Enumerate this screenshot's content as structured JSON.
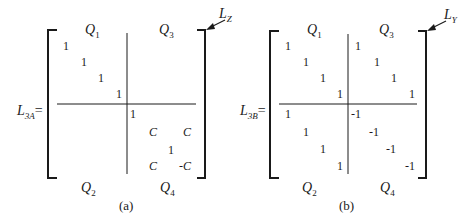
{
  "matrices": [
    {
      "id": "a",
      "label_main": "L",
      "label_sub": "3A",
      "equals": "=",
      "corner_label_main": "L",
      "corner_label_sub": "Z",
      "caption": "(a)",
      "quadrants": {
        "q1": {
          "main": "Q",
          "sub": "1"
        },
        "q2": {
          "main": "Q",
          "sub": "2"
        },
        "q3": {
          "main": "Q",
          "sub": "3"
        },
        "q4": {
          "main": "Q",
          "sub": "4"
        }
      },
      "q1_entries": [
        "1",
        "1",
        "1",
        "1"
      ],
      "q3_entries": [],
      "q2_entries": [],
      "q4_entries": [
        "1",
        "C",
        "C",
        "1",
        "C",
        "-C"
      ]
    },
    {
      "id": "b",
      "label_main": "L",
      "label_sub": "3B",
      "equals": "=",
      "corner_label_main": "L",
      "corner_label_sub": "Y",
      "caption": "(b)",
      "quadrants": {
        "q1": {
          "main": "Q",
          "sub": "1"
        },
        "q2": {
          "main": "Q",
          "sub": "2"
        },
        "q3": {
          "main": "Q",
          "sub": "3"
        },
        "q4": {
          "main": "Q",
          "sub": "4"
        }
      },
      "q1_entries": [
        "1",
        "1",
        "1",
        "1"
      ],
      "q3_entries": [
        "1",
        "1",
        "1",
        "1"
      ],
      "q2_entries": [
        "1",
        "1",
        "1",
        "1"
      ],
      "q4_entries": [
        "-1",
        "-1",
        "-1",
        "-1"
      ]
    }
  ]
}
